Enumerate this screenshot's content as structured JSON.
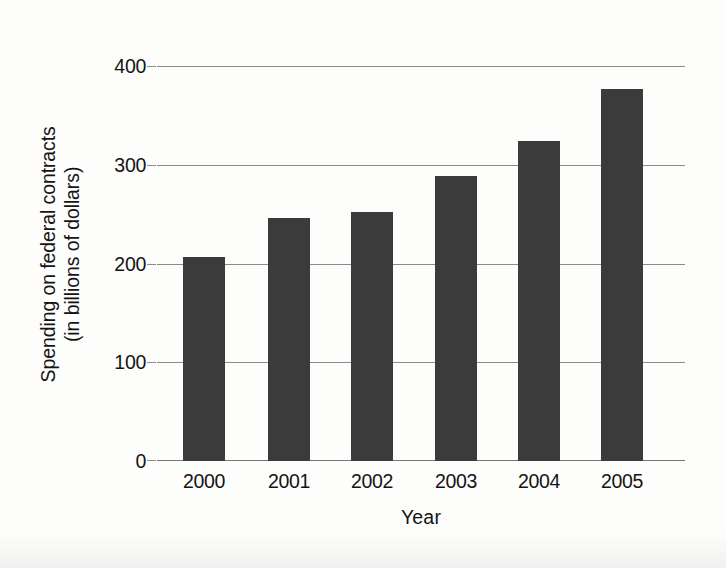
{
  "chart_data": {
    "type": "bar",
    "title": "",
    "xlabel": "Year",
    "ylabel_line1": "Spending on federal contracts",
    "ylabel_line2": "(in billions of dollars)",
    "categories": [
      "2000",
      "2001",
      "2002",
      "2003",
      "2004",
      "2005"
    ],
    "values": [
      207,
      247,
      253,
      289,
      325,
      378
    ],
    "ylim": [
      0,
      400
    ],
    "yticks": [
      0,
      100,
      200,
      300,
      400
    ],
    "ytick_labels": [
      "0",
      "100",
      "200",
      "300",
      "400"
    ],
    "grid": true,
    "legend": null,
    "bar_color": "#3b3b3b",
    "gridline_color": "#8c8c8c",
    "background_color": "#fdfdfc",
    "series": [
      {
        "name": "Spending on federal contracts",
        "values": [
          207,
          247,
          253,
          289,
          325,
          378
        ]
      }
    ]
  },
  "axis": {
    "y_tick_0": "0",
    "y_tick_1": "100",
    "y_tick_2": "200",
    "y_tick_3": "300",
    "y_tick_4": "400",
    "x_tick_0": "2000",
    "x_tick_1": "2001",
    "x_tick_2": "2002",
    "x_tick_3": "2003",
    "x_tick_4": "2004",
    "x_tick_5": "2005",
    "x_title": "Year",
    "y_title_line1": "Spending on federal contracts",
    "y_title_line2": "(in billions of dollars)"
  }
}
